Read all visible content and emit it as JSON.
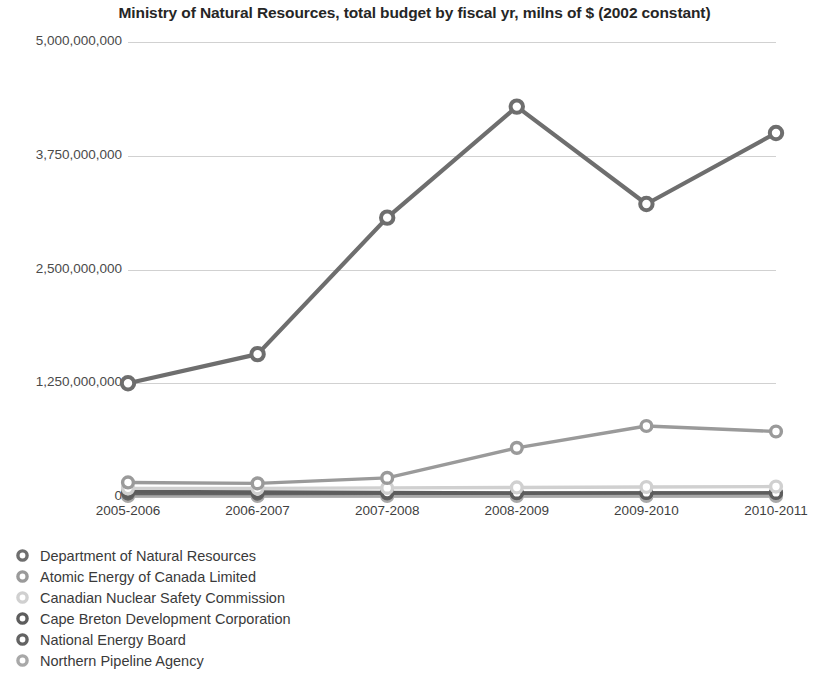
{
  "chart_data": {
    "type": "line",
    "title": "Ministry of Natural Resources, total budget by fiscal yr, milns of $ (2002 constant)",
    "xlabel": "",
    "ylabel": "",
    "categories": [
      "2005-2006",
      "2006-2007",
      "2007-2008",
      "2008-2009",
      "2009-2010",
      "2010-2011"
    ],
    "ylim": [
      0,
      5000000000
    ],
    "ytick_values": [
      0,
      1250000000,
      2500000000,
      3750000000,
      5000000000
    ],
    "ytick_labels": [
      "0",
      "1,250,000,000",
      "2,500,000,000",
      "3,750,000,000",
      "5,000,000,000"
    ],
    "grid": true,
    "legend_position": "below",
    "series": [
      {
        "name": "Department of Natural Resources",
        "color": "#6e6e6e",
        "marker": "open-circle",
        "values": [
          1250000000,
          1570000000,
          3070000000,
          4290000000,
          3220000000,
          4000000000
        ]
      },
      {
        "name": "Atomic Energy of Canada Limited",
        "color": "#9a9a9a",
        "marker": "open-circle",
        "values": [
          160000000,
          150000000,
          210000000,
          540000000,
          780000000,
          720000000
        ]
      },
      {
        "name": "Canadian Nuclear Safety Commission",
        "color": "#d0d0d0",
        "marker": "open-circle",
        "values": [
          95000000,
          95000000,
          100000000,
          105000000,
          110000000,
          115000000
        ]
      },
      {
        "name": "Cape Breton Development Corporation",
        "color": "#5d5d5d",
        "marker": "open-circle",
        "values": [
          60000000,
          55000000,
          50000000,
          45000000,
          45000000,
          45000000
        ]
      },
      {
        "name": "National Energy Board",
        "color": "#636363",
        "marker": "open-circle",
        "values": [
          38000000,
          38000000,
          40000000,
          42000000,
          44000000,
          46000000
        ]
      },
      {
        "name": "Northern Pipeline Agency",
        "color": "#a8a8a8",
        "marker": "open-circle",
        "values": [
          12000000,
          12000000,
          12000000,
          12000000,
          12000000,
          12000000
        ]
      }
    ]
  }
}
